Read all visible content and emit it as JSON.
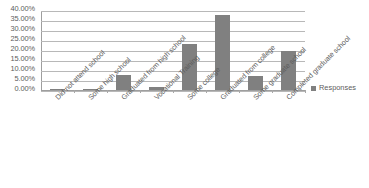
{
  "chart_data": {
    "type": "bar",
    "title": "",
    "xlabel": "",
    "ylabel": "",
    "ylim": [
      0,
      40
    ],
    "grid": true,
    "legend_position": "right",
    "categories": [
      "Did not attend school",
      "Some high school",
      "Graduated from high school",
      "Vocational Training",
      "Some college",
      "Graduated from college",
      "Some graduate school",
      "Completed graduate school"
    ],
    "series": [
      {
        "name": "Responses",
        "values": [
          0.3,
          0.3,
          7.5,
          1.5,
          23.0,
          37.5,
          7.0,
          19.5
        ]
      }
    ],
    "ytick_labels": [
      "40.00%",
      "35.00%",
      "30.00%",
      "25.00%",
      "20.00%",
      "15.00%",
      "10.00%",
      "5.00%",
      "0.00%"
    ],
    "ytick_values": [
      40,
      35,
      30,
      25,
      20,
      15,
      10,
      5,
      0
    ],
    "colors": {
      "bar": "#808080",
      "gridline": "#b8b8b8",
      "axis": "#9e9e9e",
      "text": "#5c5c5c"
    }
  },
  "legend": {
    "entries": [
      {
        "label": "Responses",
        "color": "#808080"
      }
    ]
  }
}
